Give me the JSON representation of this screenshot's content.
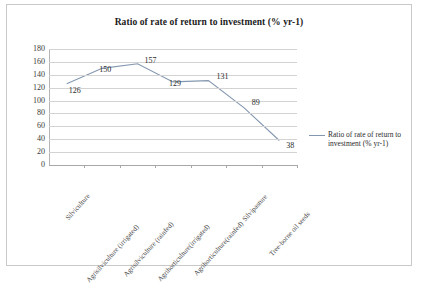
{
  "chart_data": {
    "type": "line",
    "title": "Ratio of rate of return to investment (% yr-1)",
    "xlabel": "",
    "ylabel": "",
    "ylim": [
      0,
      180
    ],
    "ytick_step": 20,
    "yticks": [
      180,
      160,
      140,
      120,
      100,
      80,
      60,
      40,
      20,
      0
    ],
    "grid": true,
    "legend_position": "right",
    "categories": [
      "Silviculture",
      "Agrisilviculture (irrigated)",
      "Agrisilviculture (rainfed)",
      "Agrihorticulture(irrigated)",
      "Agrihorticulture(rainfed)",
      "Silvipasture",
      "Tree-borne oil seeds"
    ],
    "series": [
      {
        "name": "Ratio of rate of return to investment (% yr-1)",
        "color": "#8497b0",
        "values": [
          126,
          150,
          157,
          129,
          131,
          89,
          38
        ]
      }
    ],
    "data_labels": [
      "126",
      "150",
      "157",
      "129",
      "131",
      "89",
      "38"
    ]
  },
  "legend": {
    "entries": [
      {
        "label": "Ratio of rate of return to investment (% yr-1)"
      }
    ]
  }
}
